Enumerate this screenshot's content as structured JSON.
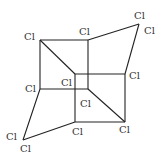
{
  "diagram": {
    "title": "",
    "atom_label": "Cl",
    "labels": [
      {
        "id": "l1",
        "text": "Cl",
        "x": 24,
        "y": 40
      },
      {
        "id": "l2",
        "text": "Cl",
        "x": 79,
        "y": 35
      },
      {
        "id": "l3",
        "text": "Cl",
        "x": 134,
        "y": 19
      },
      {
        "id": "l4",
        "text": "Cl",
        "x": 144,
        "y": 34
      },
      {
        "id": "l5",
        "text": "Cl",
        "x": 129,
        "y": 79
      },
      {
        "id": "l6",
        "text": "Cl",
        "x": 25,
        "y": 92
      },
      {
        "id": "l7",
        "text": "Cl",
        "x": 61,
        "y": 86
      },
      {
        "id": "l8",
        "text": "Cl",
        "x": 80,
        "y": 107
      },
      {
        "id": "l9",
        "text": "Cl",
        "x": 72,
        "y": 135
      },
      {
        "id": "l10",
        "text": "Cl",
        "x": 119,
        "y": 133
      },
      {
        "id": "l11",
        "text": "Cl",
        "x": 6,
        "y": 140
      },
      {
        "id": "l12",
        "text": "Cl",
        "x": 20,
        "y": 152
      }
    ]
  }
}
